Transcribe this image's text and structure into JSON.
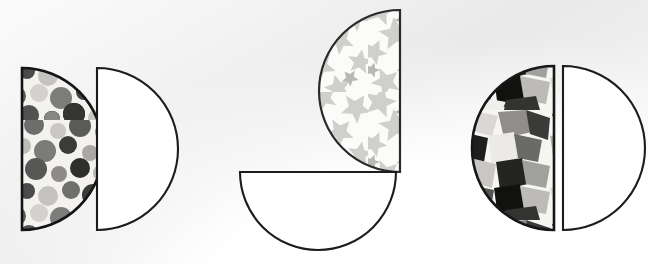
{
  "figure": {
    "title": "Row of five half-disc shapes",
    "width": 648,
    "height": 264,
    "background_color": "#eeeeee",
    "outline_color": "#1c1c1c",
    "plain_fill_color": "#ffffff",
    "shape_type": "semicircle",
    "shape_count": 5,
    "shapes": [
      {
        "index": 1,
        "name": "dotted-semicircle",
        "fill": "grayscale-polka-dot-confetti-photo",
        "flat_edge_side": "left",
        "bulge_direction": "right",
        "center_x": 22,
        "center_y": 149,
        "radius": 81,
        "outline_color": "#141414",
        "texture_name": "dots-texture",
        "texture_label": "dots"
      },
      {
        "index": 2,
        "name": "plain-semicircle-left-flat",
        "fill": "white",
        "flat_edge_side": "left",
        "bulge_direction": "right",
        "center_x": 97,
        "center_y": 149,
        "radius": 81,
        "outline_color": "#1c1c1c",
        "texture_name": "none",
        "texture_label": "plain"
      },
      {
        "index": 3,
        "name": "starred-semicircle",
        "fill": "grayscale-star-confetti-photo",
        "flat_edge_side": "right",
        "bulge_direction": "left",
        "center_x": 400,
        "center_y": 91,
        "radius": 81,
        "outline_color": "#2a2a2a",
        "texture_name": "stars-texture",
        "texture_label": "stars"
      },
      {
        "index": 4,
        "name": "plain-semicircle-top-flat",
        "fill": "white",
        "flat_edge_side": "top",
        "bulge_direction": "down",
        "center_x": 318,
        "center_y": 172,
        "radius": 78,
        "outline_color": "#1c1c1c",
        "texture_name": "none",
        "texture_label": "plain"
      },
      {
        "index": 5,
        "name": "scraps-semicircle",
        "fill": "grayscale-paper-scraps-photo",
        "flat_edge_side": "right",
        "bulge_direction": "left",
        "center_x": 554,
        "center_y": 148,
        "radius": 82,
        "outline_color": "#171717",
        "texture_name": "scraps-texture",
        "texture_label": "scraps"
      },
      {
        "index": 6,
        "name": "plain-semicircle-right-flat",
        "fill": "white",
        "flat_edge_side": "left",
        "bulge_direction": "right",
        "center_x": 563,
        "center_y": 148,
        "radius": 82,
        "outline_color": "#1c1c1c",
        "texture_name": "none",
        "texture_label": "plain"
      }
    ]
  }
}
